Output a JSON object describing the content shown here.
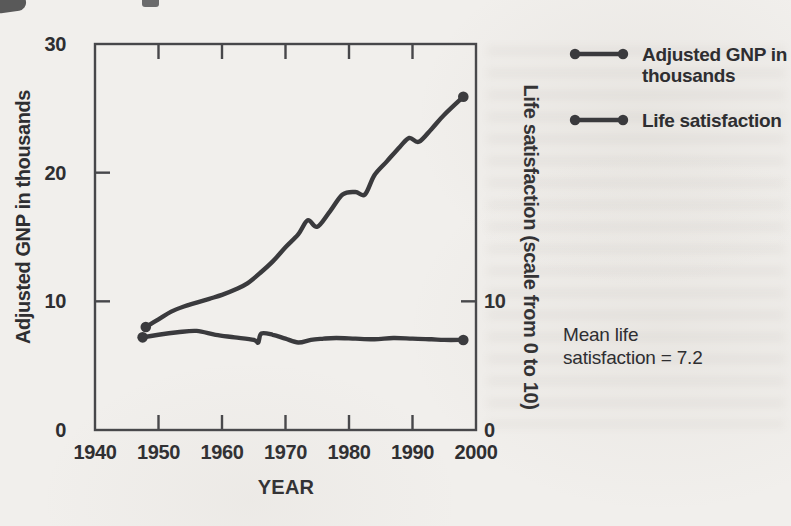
{
  "figure": {
    "ink_color": "#2e2e31",
    "axis_color": "#47474a",
    "line_color": "#3a3a3d",
    "paper_color": "#f1efec"
  },
  "chart_data": {
    "type": "line",
    "title": "",
    "xlabel": "YEAR",
    "ylabel_left": "Adjusted GNP in thousands",
    "ylabel_right": "Life satisfaction (scale from 0 to 10)",
    "xlim": [
      1940,
      2000
    ],
    "ylim_left": [
      0,
      30
    ],
    "right_axis_note": "right 0-10 scale aligns with left axis 0-10 region",
    "grid": false,
    "legend_position": "right",
    "x_ticks": [
      1940,
      1950,
      1960,
      1970,
      1980,
      1990,
      2000
    ],
    "x_tick_marks": [
      1950,
      1960,
      1970,
      1980,
      1990
    ],
    "y_left_ticks": [
      0,
      10,
      20,
      30
    ],
    "y_left_tick_marks": [
      10,
      20
    ],
    "y_right_ticks": [
      0,
      10
    ],
    "y_right_tick_marks": [
      10
    ],
    "series": [
      {
        "id": "gnp",
        "name": "Adjusted GNP in thousands",
        "endpoint_dots": true,
        "points": [
          [
            1948,
            8.0
          ],
          [
            1950,
            8.6
          ],
          [
            1952,
            9.2
          ],
          [
            1954,
            9.6
          ],
          [
            1956,
            9.9
          ],
          [
            1958,
            10.2
          ],
          [
            1960,
            10.5
          ],
          [
            1962,
            10.9
          ],
          [
            1964,
            11.4
          ],
          [
            1966,
            12.2
          ],
          [
            1968,
            13.1
          ],
          [
            1970,
            14.2
          ],
          [
            1972,
            15.2
          ],
          [
            1973.5,
            16.3
          ],
          [
            1975,
            15.8
          ],
          [
            1977,
            17.0
          ],
          [
            1979,
            18.3
          ],
          [
            1981,
            18.5
          ],
          [
            1982.5,
            18.3
          ],
          [
            1984,
            19.8
          ],
          [
            1986,
            20.9
          ],
          [
            1988,
            22.0
          ],
          [
            1989.5,
            22.7
          ],
          [
            1991,
            22.4
          ],
          [
            1993,
            23.4
          ],
          [
            1995,
            24.5
          ],
          [
            1998,
            25.9
          ]
        ]
      },
      {
        "id": "satisfaction",
        "name": "Life satisfaction",
        "endpoint_dots": true,
        "points": [
          [
            1947.5,
            7.2
          ],
          [
            1950,
            7.4
          ],
          [
            1953,
            7.6
          ],
          [
            1956,
            7.7
          ],
          [
            1959,
            7.4
          ],
          [
            1962,
            7.2
          ],
          [
            1965,
            7.0
          ],
          [
            1965.7,
            6.8
          ],
          [
            1966.2,
            7.5
          ],
          [
            1968,
            7.4
          ],
          [
            1970,
            7.1
          ],
          [
            1972,
            6.8
          ],
          [
            1974,
            7.0
          ],
          [
            1976,
            7.1
          ],
          [
            1978,
            7.15
          ],
          [
            1981,
            7.1
          ],
          [
            1984,
            7.05
          ],
          [
            1987,
            7.15
          ],
          [
            1990,
            7.1
          ],
          [
            1993,
            7.05
          ],
          [
            1995,
            7.0
          ],
          [
            1998,
            7.0
          ]
        ]
      }
    ]
  },
  "legend": {
    "items": [
      {
        "id": "gnp",
        "label_lines": [
          "Adjusted GNP in",
          "thousands"
        ]
      },
      {
        "id": "satisfaction",
        "label_lines": [
          "Life satisfaction",
          ""
        ]
      }
    ]
  },
  "annotation": {
    "line1": "Mean life",
    "line2": "satisfaction = 7.2"
  }
}
